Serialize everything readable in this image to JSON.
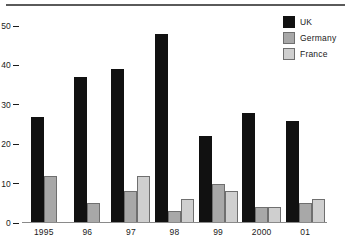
{
  "chart_data": {
    "type": "bar",
    "title": "",
    "xlabel": "",
    "ylabel": "",
    "categories": [
      "1995",
      "96",
      "97",
      "98",
      "99",
      "2000",
      "01"
    ],
    "series": [
      {
        "name": "UK",
        "color": "#111111",
        "values": [
          27,
          37,
          39,
          48,
          22,
          28,
          26
        ]
      },
      {
        "name": "Germany",
        "color": "#a8a8a8",
        "values": [
          12,
          5,
          8,
          3,
          10,
          4,
          5
        ]
      },
      {
        "name": "France",
        "color": "#cfcfcf",
        "values": [
          null,
          null,
          12,
          6,
          8,
          4,
          6
        ]
      }
    ],
    "ylim": [
      0,
      52
    ],
    "yticks": [
      "0",
      "10",
      "20",
      "30",
      "40",
      "50"
    ],
    "ytick_values": [
      0,
      10,
      20,
      30,
      40,
      50
    ],
    "grid": false,
    "legend_position": "top-right"
  },
  "legend": {
    "items": [
      {
        "label": "UK"
      },
      {
        "label": "Germany"
      },
      {
        "label": "France"
      }
    ]
  },
  "axis": {
    "y_ticks": [
      {
        "label": "50"
      },
      {
        "label": "40"
      },
      {
        "label": "30"
      },
      {
        "label": "20"
      },
      {
        "label": "10"
      },
      {
        "label": "0"
      }
    ],
    "x_labels": [
      {
        "label": "1995"
      },
      {
        "label": "96"
      },
      {
        "label": "97"
      },
      {
        "label": "98"
      },
      {
        "label": "99"
      },
      {
        "label": "2000"
      },
      {
        "label": "01"
      }
    ]
  }
}
